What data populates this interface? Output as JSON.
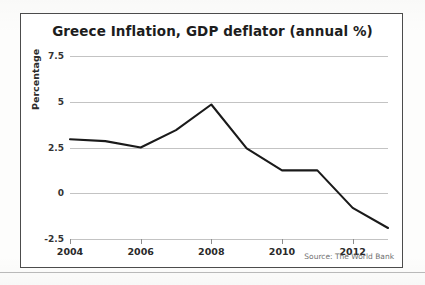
{
  "figure": {
    "title": "Greece Inflation, GDP deflator (annual %)",
    "source": "Source: The World Bank",
    "ylabel": "Percentage",
    "border_color": "#4c4c4c",
    "line_color": "#1a1a1a",
    "grid_color": "#c3c3c3"
  },
  "chart_data": {
    "type": "line",
    "title": "Greece Inflation, GDP deflator (annual %)",
    "xlabel": "",
    "ylabel": "Percentage",
    "x": [
      2004,
      2005,
      2006,
      2007,
      2008,
      2009,
      2010,
      2011,
      2012,
      2013
    ],
    "values": [
      2.95,
      2.85,
      2.5,
      3.45,
      4.85,
      2.45,
      1.25,
      1.25,
      -0.8,
      -1.9
    ],
    "series": [
      {
        "name": "Greece Inflation, GDP deflator (annual %)",
        "values": [
          2.95,
          2.85,
          2.5,
          3.45,
          4.85,
          2.45,
          1.25,
          1.25,
          -0.8,
          -1.9
        ]
      }
    ],
    "xlim": [
      2004,
      2013
    ],
    "ylim": [
      -2.5,
      7.5
    ],
    "xticks": [
      2004,
      2006,
      2008,
      2010,
      2012
    ],
    "xtick_labels": [
      "2004",
      "2006",
      "2008",
      "2010",
      "2012"
    ],
    "yticks": [
      7.5,
      5,
      2.5,
      0,
      -2.5
    ],
    "ytick_labels": [
      "7.5",
      "5",
      "2.5",
      "0",
      "-2.5"
    ],
    "grid": true,
    "grid_axis": "y",
    "legend": false,
    "annotations": [
      "Source: The World Bank"
    ]
  }
}
